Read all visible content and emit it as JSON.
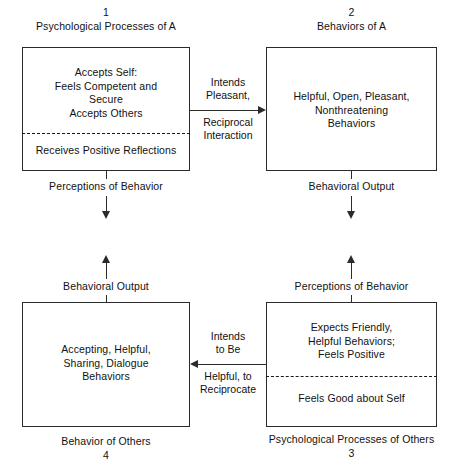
{
  "diagram": {
    "background_color": "#ffffff",
    "line_color": "#2b2b2b",
    "text_color": "#111111"
  },
  "quadrants": {
    "top_left": {
      "number": "1",
      "caption_top": "Psychological Processes of A",
      "upper_text": "Accepts Self:\nFeels Competent and\nSecure\nAccepts Others",
      "lower_text": "Receives Positive Reflections",
      "caption_bottom": "Perceptions of Behavior",
      "has_divider": true
    },
    "top_right": {
      "number": "2",
      "caption_top": "Behaviors of A",
      "upper_text": "Helpful, Open, Pleasant,\nNonthreatening\nBehaviors",
      "lower_text": "",
      "caption_bottom": "Behavioral Output",
      "has_divider": false
    },
    "bottom_left": {
      "number": "4",
      "caption_top": "Behavioral Output",
      "upper_text": "Accepting, Helpful,\nSharing, Dialogue\nBehaviors",
      "lower_text": "",
      "caption_bottom": "Behavior of Others",
      "has_divider": false
    },
    "bottom_right": {
      "number": "3",
      "caption_top": "Perceptions of Behavior",
      "upper_text": "Expects Friendly,\nHelpful Behaviors;\nFeels Positive",
      "lower_text": "Feels Good about Self",
      "caption_bottom": "Psychological Processes of Others",
      "has_divider": true
    }
  },
  "connectors": {
    "top_middle": {
      "above_label": "Intends\nPleasant,",
      "below_label": "Reciprocal\nInteraction",
      "direction": "right"
    },
    "bottom_middle": {
      "above_label": "Intends\nto Be",
      "below_label": "Helpful, to\nReciprocate",
      "direction": "left"
    },
    "right_vertical": {
      "label": "",
      "direction": "up"
    },
    "left_vertical": {
      "label": "",
      "direction": "up"
    }
  },
  "arrows": {
    "down_left": "arrow-down-icon",
    "down_right": "arrow-down-icon",
    "up_left": "arrow-up-icon",
    "up_right": "arrow-up-icon",
    "right_top": "arrow-right-icon",
    "left_bottom": "arrow-left-icon"
  }
}
